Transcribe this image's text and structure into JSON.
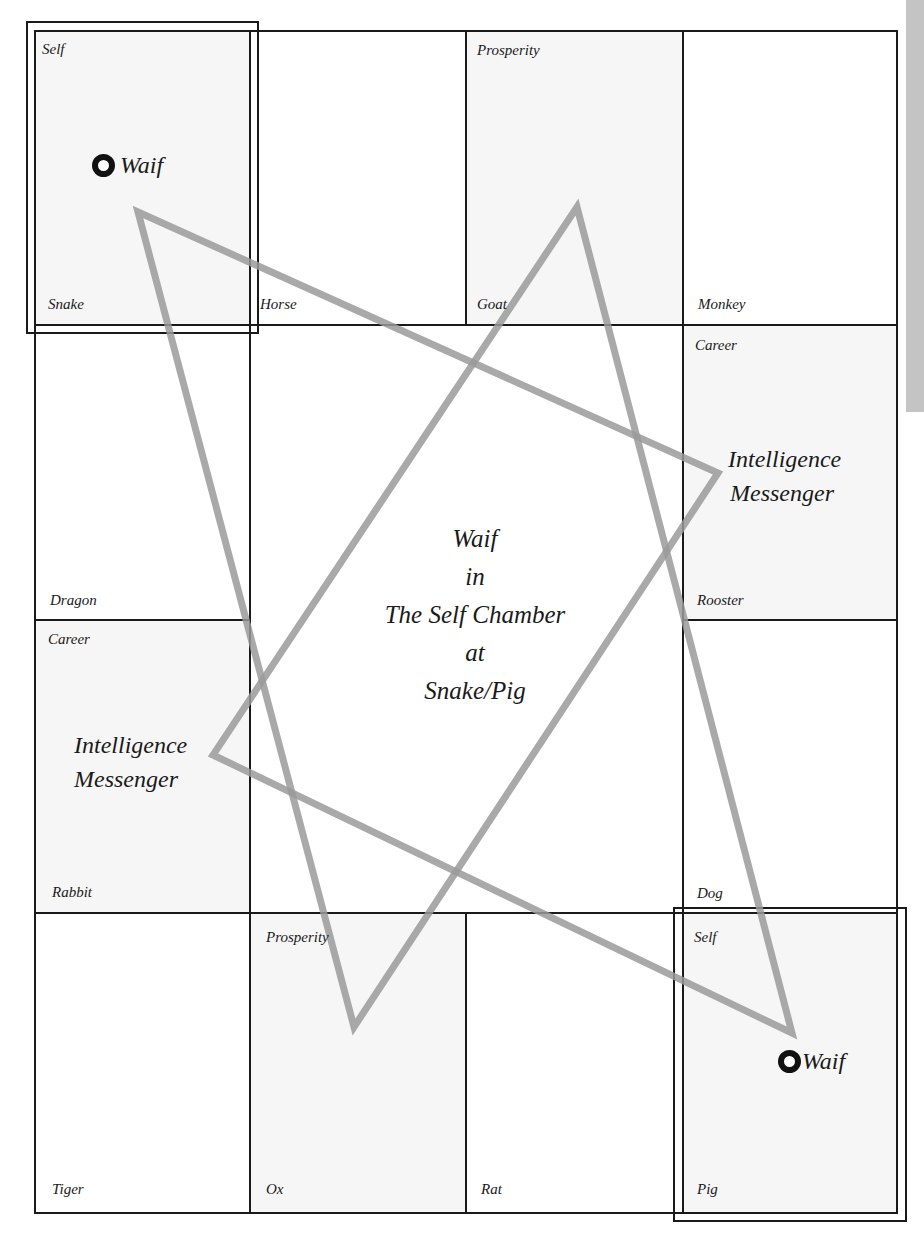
{
  "header": {
    "partial_title": "( )"
  },
  "grid": {
    "cells": [
      {
        "id": "snake",
        "branch": "Snake",
        "palace": "Self"
      },
      {
        "id": "horse",
        "branch": "Horse",
        "palace": ""
      },
      {
        "id": "goat",
        "branch": "Goat",
        "palace": "Prosperity"
      },
      {
        "id": "monkey",
        "branch": "Monkey",
        "palace": ""
      },
      {
        "id": "dragon",
        "branch": "Dragon",
        "palace": ""
      },
      {
        "id": "rooster",
        "branch": "Rooster",
        "palace": "Career"
      },
      {
        "id": "rabbit",
        "branch": "Rabbit",
        "palace": "Career"
      },
      {
        "id": "dog",
        "branch": "Dog",
        "palace": ""
      },
      {
        "id": "tiger",
        "branch": "Tiger",
        "palace": ""
      },
      {
        "id": "ox",
        "branch": "Ox",
        "palace": "Prosperity"
      },
      {
        "id": "rat",
        "branch": "Rat",
        "palace": ""
      },
      {
        "id": "pig",
        "branch": "Pig",
        "palace": "Self"
      }
    ],
    "stars": {
      "snake": "Waif",
      "pig": "Waif",
      "rooster": [
        "Intelligence",
        "Messenger"
      ],
      "rabbit": [
        "Intelligence",
        "Messenger"
      ]
    }
  },
  "center": {
    "lines": [
      "Waif",
      "in",
      "The Self Chamber",
      "at",
      "Snake/Pig"
    ]
  },
  "overlay": {
    "triangle_a": [
      [
        138,
        212
      ],
      [
        718,
        473
      ],
      [
        354,
        1027
      ]
    ],
    "triangle_b": [
      [
        577,
        207
      ],
      [
        213,
        755
      ],
      [
        792,
        1033
      ]
    ],
    "stroke_color": "#9a9a9a"
  },
  "colors": {
    "grid_line": "#1a1a1a",
    "shaded_cell": "#f6f6f6",
    "page_edge": "#c4c4c4"
  }
}
